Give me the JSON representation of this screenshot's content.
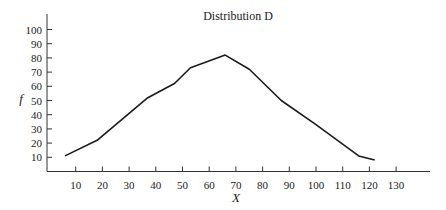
{
  "chart_data": {
    "type": "line",
    "title": "Distribution D",
    "xlabel": "X",
    "ylabel": "f",
    "x_ticks": [
      10,
      20,
      30,
      40,
      50,
      60,
      70,
      80,
      90,
      100,
      110,
      120,
      130
    ],
    "y_ticks": [
      10,
      20,
      30,
      40,
      50,
      60,
      70,
      80,
      90,
      100
    ],
    "xlim": [
      0,
      145
    ],
    "ylim": [
      0,
      105
    ],
    "grid": false,
    "legend": null,
    "series": [
      {
        "name": "Distribution D",
        "x": [
          6,
          18,
          37,
          47,
          53,
          66,
          75,
          87,
          100,
          116,
          122
        ],
        "y": [
          11,
          22,
          52,
          62,
          73,
          82,
          72,
          50,
          33,
          11,
          8
        ]
      }
    ]
  },
  "colors": {
    "line": "#1a1a1a",
    "axis": "#333333"
  }
}
